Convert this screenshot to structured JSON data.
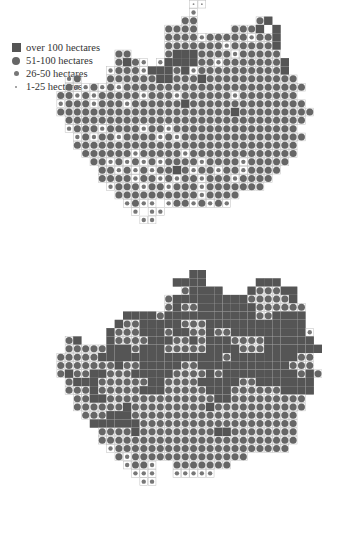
{
  "legend": {
    "items": [
      {
        "symbol": "large-square",
        "label": "over 100 hectares"
      },
      {
        "symbol": "large-circle",
        "label": "51-100 hectares"
      },
      {
        "symbol": "medium-circle",
        "label": "26-50 hectares"
      },
      {
        "symbol": "small-dot",
        "label": "1-25 hectares"
      }
    ]
  },
  "colors": {
    "square": "#555555",
    "circle_large": "#666666",
    "circle_medium": "#777777",
    "dot": "#888888",
    "grid": "#bdbdbd",
    "boundary": "#222222"
  },
  "maps": [
    {
      "id": "top-map",
      "origin": [
        40,
        0
      ],
      "cell": 8.3,
      "rows": [
        "..................**..............",
        "..................o...............",
        ".................OO.......OS......",
        "...............OOOO....OOOS.S.....",
        "...............OOOOoOOOOOoOOS.....",
        "...............OOOOOOOoOOOOOS.....",
        ".........OO....OSSSOOOOoOOOOO.....",
        ".........OSOo.oSSSSOOoOOOOOOOS....",
        "........oOOOoSSSOSoOOOOOOOOOOS....",
        "...oO...OOOOOOSSOOOSOOOOOOOOOOO...",
        "...OooOoOoOOOOOOOOOOOOOOOOOOOOOO..",
        "..OOoOoOOOOOoOOOoOOOOOOoOOOOOOO...",
        "..oOOOoOOOoOOOOOOSOOOOOOOOOOOOOO..",
        "..OOOOOOOOOOOOOOOOOOOOOSOOOOOOOOO.",
        "...OOOOOOOOOOOOOOOOOOOOOOOOOOOOO..",
        "...oOOOoOOOOoOOoOOOOOOOOOOOOOOO...",
        "....oOoOOoOOOOoOoOOOOOOOOOOOOOOO..",
        "....OOOOOOOOOOOOOOOOOOOOOOOOOOO...",
        ".....OOOOOOoOOOOOoOOOOOOOOOOOOO...",
        "......OOoOoOoOoOOOOoOOOOoOOOOO....",
        ".......OOoOoOoOOSOoOOoOOoOOOO.....",
        ".......OOOOoOOoOoOOoOOOoOOOO......",
        "........oOOOoOOoOOOoOOOOOOO.......",
        ".........OOOOOOOOOOoOOOO..........",
        "..........oOoo.oOOoOoOo...........",
        "...........o.oo...................",
        "............oo...................."
      ]
    },
    {
      "id": "bottom-map",
      "origin": [
        40,
        270
      ],
      "cell": 8.3,
      "rows": [
        "..................SS..............",
        "................SSSS......SSS.....",
        ".................OSSSS...SOOOSS...",
        "...............OSSSSSSSSSOOOOOS...",
        "...............OSOOSSSSSSSOOOOOO..",
        "..........SSSSOSSSSSSSSSSSOOSSSS..",
        ".........SOOSSSSSOOOSSSSSSSSSSSS..",
        "........SOOOSSSOSSOOSOOSSSSSSSSSo.",
        "...OS...SOOOOSSSOOSOSSSOOOOSSSSSS.",
        "...OOOOOSSSOSSSOOOOOSSSSOOOSSSSSSS",
        "..OOOOOSSSSSSSSSSSSSSSOSSSSSSSSOO.",
        "..OOOOOOOSOOSSSSSOOSSSSSSSSSSSOOO.",
        "..OSOOSSOOOSSSSSOOOOSOSSSSSSSSSOSO",
        "...OSSSOOOOOOSSOOOOSSSSSOOSSSSSSS.",
        "...OOOSOOOOOSSSOOOOOSSSOOOOOOSSSS.",
        "....OOSSOOOOOOOOOOOOOSSOOOOOOOOO..",
        "....OOOOOOSOOOOOOOOOSOOOOOOOOOOO..",
        ".....OOOSSSOOOOOOOOOOOOOOOOOOOO...",
        "......SSSSSSOOOOOOOOOOOOOOOOOOO...",
        ".......OOOOSOOOOOOOOOSSOOOOOOOO...",
        ".......OOOOOOOOOOOOOOOOOOOOOOOO...",
        "........oOOOOOOOOOOOOOOOOOOOOO....",
        ".........OoOOOOOOOOOOOOOO.........",
        "..........oOOo..OOOOOOO...........",
        "...........ooo..ooooo.............",
        "............oo...................."
      ]
    }
  ]
}
